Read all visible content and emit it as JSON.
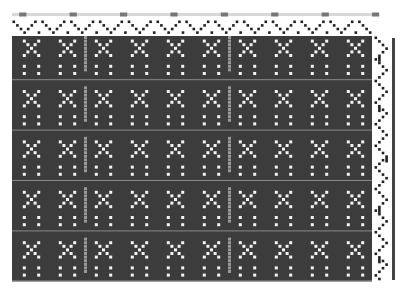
{
  "draft": {
    "title": "Weaving draft drawdown",
    "colors": {
      "background": "#ffffff",
      "warp_dark": "#3c3c3c",
      "weft_light": "#f4f4f4",
      "accent_grey": "#9a9a9a",
      "threading_mark": "#222222",
      "color_bar_mark": "#777777",
      "edge_bar": "#444444"
    },
    "cell_size": 3.6,
    "grid": {
      "x": 12,
      "y": 36,
      "cols": 100,
      "rows": 68
    },
    "threading": {
      "x": 12,
      "y": 20,
      "rows": 4,
      "pattern": [
        0,
        1,
        2,
        3,
        2,
        1,
        0,
        3
      ]
    },
    "warp_color_bar": {
      "x": 12,
      "y": 13,
      "mark_every": 14
    },
    "treadling": {
      "x": 374,
      "y": 36,
      "cols": 4,
      "pattern": [
        0,
        1,
        2,
        3,
        2,
        1
      ]
    },
    "edge_bar": {
      "x": 392,
      "y": 38,
      "width": 3,
      "height": 242
    }
  }
}
